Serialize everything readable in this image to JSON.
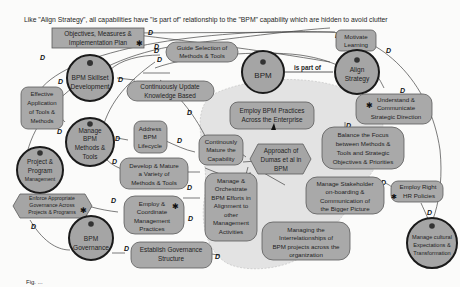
{
  "caption": "Like \"Align Strategy\", all capabilities have \"is part of\" relationship to the \"BPM\" capability which are hidden to avoid clutter",
  "edge_label_is_part_of": "is part of",
  "relationship_marker": "D",
  "footer_caption": "Fig. ...",
  "capabilities": {
    "bpm": "BPM",
    "align_strategy": [
      "Align",
      "Strategy"
    ],
    "bpm_skillset": [
      "BPM Skillset",
      "Development"
    ],
    "manage_bpm_methods": [
      "Manage",
      "BPM",
      "Methods &",
      "Tools"
    ],
    "project_program": [
      "Project &",
      "Program",
      "Management"
    ],
    "bpm_governance": [
      "BPM",
      "Governance"
    ],
    "manage_cultural": [
      "Manage cultural",
      "Expectations &",
      "Transformation"
    ]
  },
  "practices": {
    "objectives": [
      "Objectives, Measures &",
      "Implementation Plan"
    ],
    "motivate_learning": [
      "Motivate",
      "Learning"
    ],
    "guide_selection": [
      "Guide Selection of",
      "Methods & Tools"
    ],
    "continuously_update": [
      "Continuously Update",
      "Knowledge Based"
    ],
    "effective_application": [
      "Effective",
      "Application",
      "of Tools &",
      "Methods"
    ],
    "address_lifecycle": [
      "Address",
      "BPM",
      "Lifecycle"
    ],
    "develop_mature": [
      "Develop & Mature",
      "a Variety of",
      "Methods & Tools"
    ],
    "continuously_mature": [
      "Continously",
      "Mature the",
      "Capability"
    ],
    "employ_bpm_practices": [
      "Employ BPM Practices",
      "Across the Enterprise"
    ],
    "understand_communicate": [
      "Understand &",
      "Communicate",
      "Strategic Direction"
    ],
    "balance_focus": [
      "Balance the Focus",
      "between Methods &",
      "Tools and Strategic",
      "Objectives & Priorities"
    ],
    "approach_dumas": [
      "Approach of",
      "Dumas et al in",
      "BPM"
    ],
    "manage_orchestrate": [
      "Manage &",
      "Orchestrate",
      "BPM Efforts in",
      "Alignment to",
      "other",
      "Management",
      "Activities"
    ],
    "manage_stakeholder": [
      "Manage Stakeholder",
      "on-boarding &",
      "Communication of",
      "the Bigger Picture"
    ],
    "employ_hr": [
      "Employ Right",
      "HR Policies"
    ],
    "enforce_governance": [
      "Enforce Appropriate",
      "Governance Across",
      "Projects & Programs"
    ],
    "employ_coordinate": [
      "Employ &",
      "Coordinate",
      "Management",
      "Practices"
    ],
    "establish_governance": [
      "Establish Governance",
      "Structure"
    ],
    "managing_interrelationships": [
      "Managing the",
      "Interrelationships of",
      "BPM projects across the",
      "organization"
    ]
  },
  "colors": {
    "node_fill": "#a7a7a7",
    "circle_stroke": "#1a1a1a",
    "region_fill": "#e3e3e3",
    "background": "#fbfbfa"
  }
}
